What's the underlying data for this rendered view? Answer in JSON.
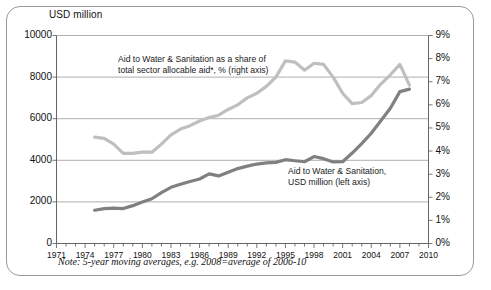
{
  "figure": {
    "left_axis_title": "USD million",
    "note": "Note: 5-year moving averages, e.g. 2008=average of 2006-10",
    "annotation_right_line1": "Aid to Water & Sanitation  as a share of",
    "annotation_right_line2": "total sector allocable aid*, % (right axis)",
    "annotation_left_line1": "Aid to Water & Sanitation,",
    "annotation_left_line2": "USD million (left axis)",
    "colors": {
      "series_usd": "#808080",
      "series_pct": "#bfbfbf",
      "gridline": "#9a9a9a",
      "axis": "#555555",
      "frame": "#9a9a9a",
      "text": "#111111"
    }
  },
  "chart_data": {
    "type": "line",
    "title": "",
    "subtitle": "",
    "xlabel": "",
    "ylabel": "USD million",
    "y2label": "%",
    "xlim": [
      1971,
      2010
    ],
    "ylim": [
      0,
      10000
    ],
    "y2lim": [
      0,
      9
    ],
    "grid": true,
    "gridlines_left": [
      2000,
      4000,
      6000,
      8000,
      10000
    ],
    "legend": "annotations-inline",
    "xticks_labeled": [
      1971,
      1974,
      1977,
      1980,
      1983,
      1986,
      1989,
      1992,
      1995,
      1998,
      2001,
      2004,
      2007,
      2010
    ],
    "xticks_minor_step": 1,
    "yticks_left": [
      0,
      2000,
      4000,
      6000,
      8000,
      10000
    ],
    "yticks_right": [
      "0%",
      "1%",
      "2%",
      "3%",
      "4%",
      "5%",
      "6%",
      "7%",
      "8%",
      "9%"
    ],
    "x": [
      1975,
      1976,
      1977,
      1978,
      1979,
      1980,
      1981,
      1982,
      1983,
      1984,
      1985,
      1986,
      1987,
      1988,
      1989,
      1990,
      1991,
      1992,
      1993,
      1994,
      1995,
      1996,
      1997,
      1998,
      1999,
      2000,
      2001,
      2002,
      2003,
      2004,
      2005,
      2006,
      2007,
      2008
    ],
    "series": [
      {
        "name": "Aid to Water & Sanitation, USD million (left axis)",
        "axis": "left",
        "unit": "USD million",
        "color": "#808080",
        "values": [
          1600,
          1680,
          1700,
          1680,
          1820,
          2000,
          2150,
          2450,
          2700,
          2850,
          2980,
          3100,
          3350,
          3250,
          3430,
          3600,
          3720,
          3820,
          3880,
          3900,
          4030,
          3980,
          3930,
          4180,
          4080,
          3920,
          3930,
          4350,
          4800,
          5300,
          5900,
          6500,
          7300,
          7420
        ]
      },
      {
        "name": "Aid to Water & Sanitation as a share of total sector allocable aid*, % (right axis)",
        "axis": "right",
        "unit": "%",
        "color": "#bfbfbf",
        "values": [
          4.6,
          4.55,
          4.3,
          3.9,
          3.9,
          3.95,
          3.95,
          4.3,
          4.7,
          4.95,
          5.1,
          5.3,
          5.45,
          5.55,
          5.8,
          6.0,
          6.3,
          6.5,
          6.8,
          7.2,
          7.9,
          7.85,
          7.5,
          7.8,
          7.75,
          7.2,
          6.5,
          6.05,
          6.1,
          6.4,
          6.9,
          7.3,
          7.75,
          6.85
        ]
      }
    ],
    "annotations": [
      {
        "text": "Aid to Water & Sanitation  as a share of total sector allocable aid*, % (right axis)",
        "target_series": 1
      },
      {
        "text": "Aid to Water & Sanitation, USD million (left axis)",
        "target_series": 0
      }
    ]
  }
}
